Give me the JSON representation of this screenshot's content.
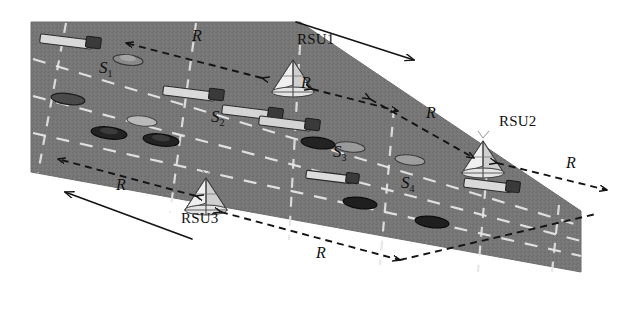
{
  "figure": {
    "background_color": "#ffffff",
    "road_color": "#767676",
    "lane_marking_color": "#e8e8e8",
    "line_color": "#1a1a1a"
  },
  "rsus": [
    {
      "id": "rsu1",
      "label": "RSU1",
      "x": 293,
      "y": 82,
      "label_x": 299,
      "label_y": 38
    },
    {
      "id": "rsu2",
      "label": "RSU2",
      "x": 483,
      "y": 163,
      "label_x": 500,
      "label_y": 122
    },
    {
      "id": "rsu3",
      "label": "RSU3",
      "x": 206,
      "y": 199,
      "label_x": 186,
      "label_y": 217
    }
  ],
  "segments": [
    {
      "id": "s1",
      "label": "S",
      "sub": "1",
      "x": 106,
      "y": 68
    },
    {
      "id": "s2",
      "label": "S",
      "sub": "2",
      "x": 218,
      "y": 117
    },
    {
      "id": "s3",
      "label": "S",
      "sub": "3",
      "x": 340,
      "y": 152
    },
    {
      "id": "s4",
      "label": "S",
      "sub": "4",
      "x": 408,
      "y": 183
    }
  ],
  "range_labels": [
    {
      "id": "r-top-left",
      "text": "R",
      "x": 196,
      "y": 36
    },
    {
      "id": "r-rsu1-right",
      "text": "R",
      "x": 305,
      "y": 83
    },
    {
      "id": "r-mid-right",
      "text": "R",
      "x": 430,
      "y": 113
    },
    {
      "id": "r-far-right",
      "text": "R",
      "x": 570,
      "y": 163
    },
    {
      "id": "r-bot-left",
      "text": "R",
      "x": 120,
      "y": 185
    },
    {
      "id": "r-bot-mid",
      "text": "R",
      "x": 320,
      "y": 253
    }
  ],
  "range_arrows": [
    {
      "id": "arrow-r-top-left",
      "x1": 262,
      "y1": 78,
      "x2": 126,
      "y2": 43,
      "double": true
    },
    {
      "id": "arrow-r-rsu1-right",
      "x1": 312,
      "y1": 89,
      "x2": 398,
      "y2": 111,
      "double": true
    },
    {
      "id": "arrow-r-mid-right",
      "x1": 370,
      "y1": 99,
      "x2": 474,
      "y2": 158,
      "double": true
    },
    {
      "id": "arrow-r-far-right",
      "x1": 497,
      "y1": 163,
      "x2": 607,
      "y2": 190,
      "double": true
    },
    {
      "id": "arrow-r-bot-left",
      "x1": 196,
      "y1": 196,
      "x2": 58,
      "y2": 159,
      "double": true
    },
    {
      "id": "arrow-r-bot-mid",
      "x1": 221,
      "y1": 212,
      "x2": 400,
      "y2": 260,
      "double": true
    },
    {
      "id": "arrow-r-bot-right",
      "x1": 400,
      "y1": 260,
      "x2": 590,
      "y2": 215,
      "double": false
    }
  ],
  "direction_arrows": [
    {
      "id": "direction-arrow-eastbound",
      "label": "",
      "x1": 296,
      "y1": 22,
      "x2": 416,
      "y2": 61
    },
    {
      "id": "direction-arrow-westbound",
      "label": "",
      "x1": 192,
      "y1": 239,
      "x2": 63,
      "y2": 191
    }
  ],
  "vehicles": [
    {
      "id": "truck-1",
      "type": "truck",
      "x": 78,
      "y": 45,
      "shade": "light"
    },
    {
      "id": "car-1",
      "type": "car",
      "x": 128,
      "y": 60,
      "shade": "light"
    },
    {
      "id": "car-2",
      "type": "car",
      "x": 68,
      "y": 99,
      "shade": "dark"
    },
    {
      "id": "truck-2",
      "type": "truck",
      "x": 196,
      "y": 95,
      "shade": "light"
    },
    {
      "id": "truck-3",
      "type": "truck",
      "x": 255,
      "y": 114,
      "shade": "light"
    },
    {
      "id": "truck-4",
      "type": "truck",
      "x": 292,
      "y": 124,
      "shade": "light"
    },
    {
      "id": "car-3",
      "type": "car",
      "x": 142,
      "y": 121,
      "shade": "light"
    },
    {
      "id": "car-4",
      "type": "car",
      "x": 109,
      "y": 133,
      "shade": "dark"
    },
    {
      "id": "car-5",
      "type": "car",
      "x": 161,
      "y": 140,
      "shade": "dark"
    },
    {
      "id": "car-6",
      "type": "car",
      "x": 318,
      "y": 143,
      "shade": "dark"
    },
    {
      "id": "car-7",
      "type": "car",
      "x": 350,
      "y": 147,
      "shade": "light"
    },
    {
      "id": "car-8",
      "type": "car",
      "x": 410,
      "y": 160,
      "shade": "light"
    },
    {
      "id": "truck-5",
      "type": "truck",
      "x": 332,
      "y": 177,
      "shade": "light"
    },
    {
      "id": "truck-6",
      "type": "truck",
      "x": 492,
      "y": 186,
      "shade": "light"
    },
    {
      "id": "car-9",
      "type": "car",
      "x": 360,
      "y": 203,
      "shade": "dark"
    },
    {
      "id": "car-10",
      "type": "car",
      "x": 432,
      "y": 222,
      "shade": "dark"
    }
  ]
}
